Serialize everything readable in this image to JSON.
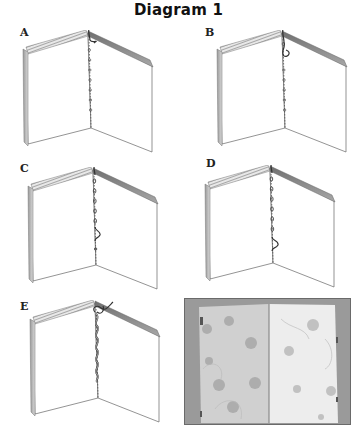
{
  "title": "Diagram 1",
  "panels": [
    {
      "id": "A",
      "label": "A",
      "step": "thread enters at top of spine, running stitch along fold",
      "loop_position": "top"
    },
    {
      "id": "B",
      "label": "B",
      "step": "first loop formed near top of spine",
      "loop_position": "upper"
    },
    {
      "id": "C",
      "label": "C",
      "step": "loop formed near lower part of spine",
      "loop_position": "lower"
    },
    {
      "id": "D",
      "label": "D",
      "step": "loop formed near bottom of spine",
      "loop_position": "bottom"
    },
    {
      "id": "E",
      "label": "E",
      "step": "completed wrapped chain stitch along spine",
      "loop_position": "wrapped"
    }
  ],
  "photo": {
    "caption": "",
    "description": "Photograph of finished open booklet with spotted handmade paper pages"
  },
  "colors": {
    "line": "#555555",
    "spine_hatch": "#8a8a8a",
    "cover_edge": "#777777",
    "photo_bg": "#8f8f8f",
    "page_left": "#d4d4d4",
    "page_right": "#ececec"
  }
}
